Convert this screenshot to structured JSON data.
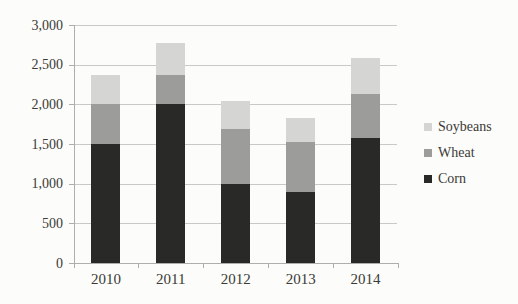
{
  "chart_data": {
    "type": "bar",
    "stacked": true,
    "title": "",
    "xlabel": "",
    "ylabel": "",
    "categories": [
      "2010",
      "2011",
      "2012",
      "2013",
      "2014"
    ],
    "series": [
      {
        "name": "Corn",
        "color": "#292927",
        "values": [
          1500,
          2000,
          1000,
          900,
          1580
        ]
      },
      {
        "name": "Wheat",
        "color": "#9c9c9a",
        "values": [
          500,
          370,
          690,
          620,
          550
        ]
      },
      {
        "name": "Soybeans",
        "color": "#d5d5d3",
        "values": [
          370,
          400,
          350,
          310,
          450
        ]
      }
    ],
    "stack_order_bottom_to_top": [
      "Corn",
      "Wheat",
      "Soybeans"
    ],
    "ylim": [
      0,
      3000
    ],
    "yticks": [
      0,
      500,
      1000,
      1500,
      2000,
      2500,
      3000
    ],
    "ytick_labels": [
      "0",
      "500",
      "1,000",
      "1,500",
      "2,000",
      "2,500",
      "3,000"
    ],
    "grid": true,
    "legend_position": "right",
    "legend_order": [
      "Soybeans",
      "Wheat",
      "Corn"
    ]
  },
  "colors": {
    "background": "#fcfcfa",
    "gridline": "#c9c9c6",
    "axis": "#aeaeaa",
    "text": "#3a3a36"
  }
}
